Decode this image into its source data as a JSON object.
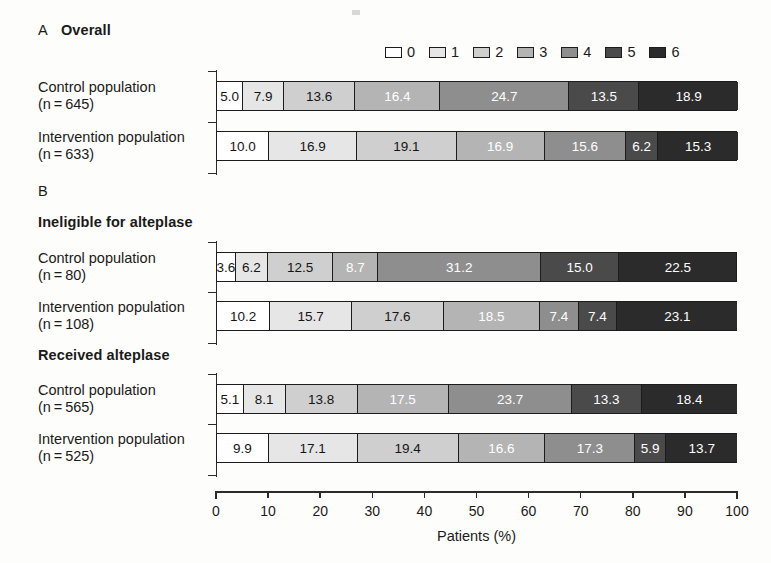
{
  "panels": {
    "a": {
      "letter": "A",
      "title": "Overall"
    },
    "b": {
      "letter": "B",
      "subtitle_1": "Ineligible for alteplase",
      "subtitle_2": "Received alteplase"
    }
  },
  "legend": {
    "title": "",
    "entries": [
      {
        "label": "0",
        "color": "#ffffff"
      },
      {
        "label": "1",
        "color": "#e6e6e6"
      },
      {
        "label": "2",
        "color": "#cfcfcf"
      },
      {
        "label": "3",
        "color": "#b4b4b4"
      },
      {
        "label": "4",
        "color": "#8e8e8e"
      },
      {
        "label": "5",
        "color": "#4a4a4a"
      },
      {
        "label": "6",
        "color": "#2b2b2b"
      }
    ]
  },
  "xaxis": {
    "title": "Patients (%)",
    "ticks": [
      "0",
      "10",
      "20",
      "30",
      "40",
      "50",
      "60",
      "70",
      "80",
      "90",
      "100"
    ],
    "min": 0,
    "max": 100
  },
  "rows": [
    {
      "group": "Overall",
      "label_line1": "Control population",
      "label_line2": "(n = 645)",
      "values": [
        "5.0",
        "7.9",
        "13.6",
        "16.4",
        "24.7",
        "13.5",
        "18.9"
      ]
    },
    {
      "group": "Overall",
      "label_line1": "Intervention population",
      "label_line2": "(n = 633)",
      "values": [
        "10.0",
        "16.9",
        "19.1",
        "16.9",
        "15.6",
        "6.2",
        "15.3"
      ]
    },
    {
      "group": "Ineligible for alteplase",
      "label_line1": "Control population",
      "label_line2": "(n = 80)",
      "values": [
        "3.6",
        "6.2",
        "12.5",
        "8.7",
        "31.2",
        "15.0",
        "22.5"
      ]
    },
    {
      "group": "Ineligible for alteplase",
      "label_line1": "Intervention population",
      "label_line2": "(n = 108)",
      "values": [
        "10.2",
        "15.7",
        "17.6",
        "18.5",
        "7.4",
        "7.4",
        "23.1"
      ]
    },
    {
      "group": "Received alteplase",
      "label_line1": "Control population",
      "label_line2": "(n = 565)",
      "values": [
        "5.1",
        "8.1",
        "13.8",
        "17.5",
        "23.7",
        "13.3",
        "18.4"
      ]
    },
    {
      "group": "Received alteplase",
      "label_line1": "Intervention population",
      "label_line2": "(n = 525)",
      "values": [
        "9.9",
        "17.1",
        "19.4",
        "16.6",
        "17.3",
        "5.9",
        "13.7"
      ]
    }
  ],
  "chart_data": {
    "type": "bar",
    "orientation": "horizontal",
    "stacked": true,
    "normalized_percent": true,
    "title": "",
    "xlabel": "Patients (%)",
    "ylabel": "",
    "xlim": [
      0,
      100
    ],
    "xticks": [
      0,
      10,
      20,
      30,
      40,
      50,
      60,
      70,
      80,
      90,
      100
    ],
    "grid": false,
    "legend_position": "top-right",
    "legend_title": "",
    "series": [
      {
        "name": "0",
        "color": "#ffffff",
        "values": [
          5.0,
          10.0,
          3.6,
          10.2,
          5.1,
          9.9
        ]
      },
      {
        "name": "1",
        "color": "#e6e6e6",
        "values": [
          7.9,
          16.9,
          6.2,
          15.7,
          8.1,
          17.1
        ]
      },
      {
        "name": "2",
        "color": "#cfcfcf",
        "values": [
          13.6,
          19.1,
          12.5,
          17.6,
          13.8,
          19.4
        ]
      },
      {
        "name": "3",
        "color": "#b4b4b4",
        "values": [
          16.4,
          16.9,
          8.7,
          18.5,
          17.5,
          16.6
        ]
      },
      {
        "name": "4",
        "color": "#8e8e8e",
        "values": [
          24.7,
          15.6,
          31.2,
          7.4,
          23.7,
          17.3
        ]
      },
      {
        "name": "5",
        "color": "#4a4a4a",
        "values": [
          13.5,
          6.2,
          15.0,
          7.4,
          13.3,
          5.9
        ]
      },
      {
        "name": "6",
        "color": "#2b2b2b",
        "values": [
          18.9,
          15.3,
          22.5,
          23.1,
          18.4,
          13.7
        ]
      }
    ],
    "categories": [
      "Overall — Control population (n=645)",
      "Overall — Intervention population (n=633)",
      "Ineligible for alteplase — Control population (n=80)",
      "Ineligible for alteplase — Intervention population (n=108)",
      "Received alteplase — Control population (n=565)",
      "Received alteplase — Intervention population (n=525)"
    ],
    "panels": [
      {
        "letter": "A",
        "title": "Overall",
        "category_indices": [
          0,
          1
        ]
      },
      {
        "letter": "B",
        "title": "Ineligible for alteplase",
        "category_indices": [
          2,
          3
        ]
      },
      {
        "letter": "B",
        "title": "Received alteplase",
        "category_indices": [
          4,
          5
        ]
      }
    ]
  }
}
